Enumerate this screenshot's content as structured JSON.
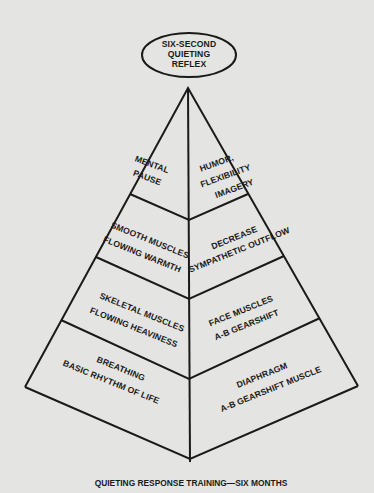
{
  "diagram": {
    "type": "pyramid",
    "apex_label": {
      "lines": [
        "SIX-SECOND",
        "QUIETING",
        "REFLEX"
      ]
    },
    "levels": [
      {
        "level": 1,
        "left": {
          "lines": [
            "MENTAL",
            "PAUSE"
          ]
        },
        "right": {
          "lines": [
            "HUMOR,",
            "FLEXIBILITY",
            "IMAGERY"
          ]
        }
      },
      {
        "level": 2,
        "left": {
          "lines": [
            "SMOOTH MUSCLES",
            "FLOWING WARMTH"
          ]
        },
        "right": {
          "lines": [
            "DECREASE",
            "SYMPATHETIC OUTFLOW"
          ]
        }
      },
      {
        "level": 3,
        "left": {
          "lines": [
            "SKELETAL MUSCLES",
            "FLOWING HEAVINESS"
          ]
        },
        "right": {
          "lines": [
            "FACE MUSCLES",
            "A-B GEARSHIFT"
          ]
        }
      },
      {
        "level": 4,
        "left": {
          "lines": [
            "BREATHING",
            "BASIC RHYTHM OF LIFE"
          ]
        },
        "right": {
          "lines": [
            "DIAPHRAGM",
            "A-B GEARSHIFT MUSCLE"
          ]
        }
      }
    ],
    "caption": "QUIETING RESPONSE TRAINING—SIX MONTHS"
  },
  "colors": {
    "background": "#e4e4e2",
    "ink": "#1a1a1a"
  }
}
